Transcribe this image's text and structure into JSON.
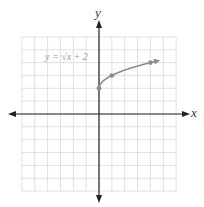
{
  "chart_data": {
    "type": "line",
    "title": "",
    "xlabel": "x",
    "ylabel": "y",
    "annotation": "y = √x + 2",
    "xlim": [
      -6,
      6
    ],
    "ylim": [
      -6,
      6
    ],
    "grid": true,
    "legend": "none",
    "series": [
      {
        "name": "y = √x + 2",
        "function": "sqrt(x)+2",
        "domain": [
          0,
          4.6
        ],
        "marked_points": [
          [
            0,
            2
          ],
          [
            1,
            3
          ],
          [
            4,
            4
          ]
        ],
        "end_arrow": true,
        "color": "#8c8c8c"
      }
    ]
  },
  "labels": {
    "x_axis": "x",
    "y_axis": "y",
    "equation": "y = √x + 2"
  },
  "colors": {
    "grid": "#d9d9d9",
    "axis": "#222222",
    "curve": "#8c8c8c"
  }
}
